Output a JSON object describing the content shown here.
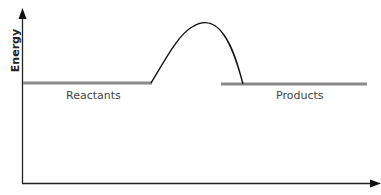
{
  "diagram": {
    "type": "energy-profile",
    "y_axis_label": "Energy",
    "x_axis_label": "",
    "labels": {
      "reactants": "Reactants",
      "products": "Products"
    },
    "colors": {
      "levels": "#8a8a8a",
      "curve": "#111111",
      "axes": "#222222"
    }
  }
}
